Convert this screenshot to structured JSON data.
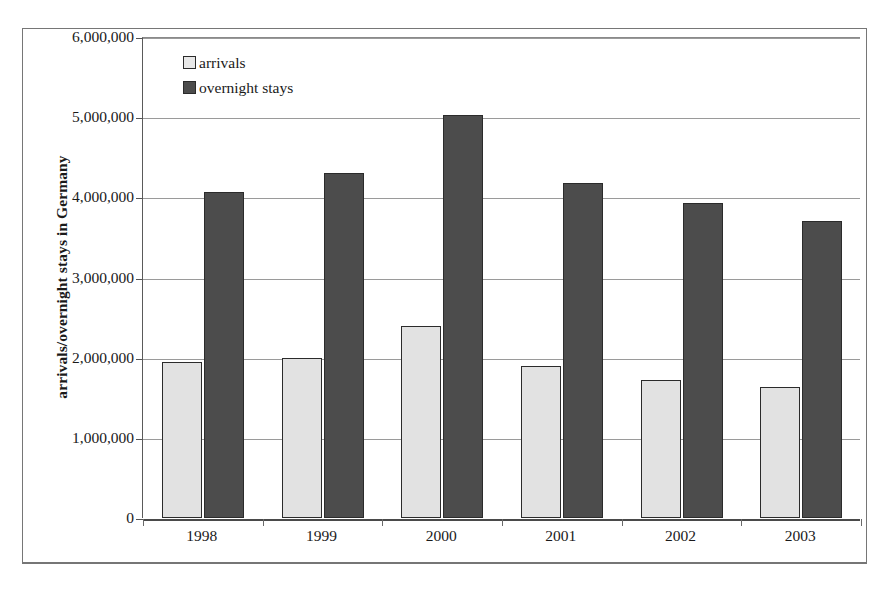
{
  "chart_data": {
    "type": "bar",
    "title": "",
    "xlabel": "",
    "ylabel": "arrivals/overnight stays in Germany",
    "categories": [
      "1998",
      "1999",
      "2000",
      "2001",
      "2002",
      "2003"
    ],
    "series": [
      {
        "name": "arrivals",
        "color": "#e2e2e2",
        "values": [
          1950000,
          2000000,
          2390000,
          1900000,
          1720000,
          1630000
        ]
      },
      {
        "name": "overnight stays",
        "color": "#4c4c4c",
        "values": [
          4070000,
          4300000,
          5030000,
          4180000,
          3930000,
          3700000
        ]
      }
    ],
    "ylim": [
      0,
      6000000
    ],
    "ytick_values": [
      0,
      1000000,
      2000000,
      3000000,
      4000000,
      5000000,
      6000000
    ],
    "ytick_labels": [
      "0",
      "1,000,000",
      "2,000,000",
      "3,000,000",
      "4,000,000",
      "5,000,000",
      "6,000,000"
    ],
    "grid": true,
    "legend_position": "top-left-inside",
    "legend_entries": [
      "arrivals",
      "overnight stays"
    ]
  }
}
